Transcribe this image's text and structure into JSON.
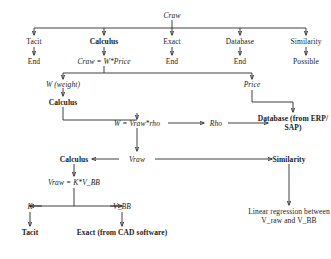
{
  "diagram": {
    "stroke_color": "#2b2b2b",
    "text_color": "#1a1a1a",
    "background": "#ffffff",
    "nodes": {
      "root": "Craw",
      "method_tacit": "Tacit",
      "method_calculus": "Calculus",
      "method_exact": "Exact",
      "method_database": "Database",
      "method_similarity": "Similarity",
      "end_tacit": "End",
      "end_exact": "End",
      "end_database": "End",
      "possible_similarity": "Possible",
      "formula_craw": "Craw = W*Price",
      "w_weight": "W (weight)",
      "price": "Price",
      "calculus_w": "Calculus",
      "database_erp": "Database\n(from ERP/\nSAP)",
      "formula_w": "W = Vraw*rho",
      "rho": "Rho",
      "calculus_vraw": "Calculus",
      "vraw": "Vraw",
      "similarity_vraw": "Similarity",
      "formula_vraw": "Vraw = K*V_BB",
      "k": "K",
      "v_bb": "V_BB",
      "tacit_k": "Tacit",
      "exact_cad": "Exact (from CAD\nsoftware)",
      "linear_regression": "Linear regression\nbetween V_raw\nand V_BB"
    }
  }
}
